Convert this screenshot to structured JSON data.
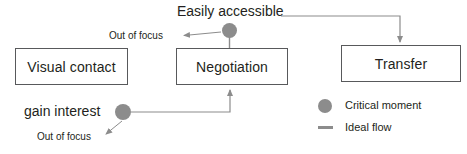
{
  "diagram": {
    "nodes": [
      {
        "id": "visual-contact",
        "label": "Visual contact"
      },
      {
        "id": "negotiation",
        "label": "Negotiation"
      },
      {
        "id": "transfer",
        "label": "Transfer"
      }
    ],
    "labels": {
      "easily_accessible": "Easily accessible",
      "gain_interest": "gain interest",
      "out_of_focus_top": "Out of focus",
      "out_of_focus_bottom": "Out of focus"
    },
    "legend": {
      "critical_moment": "Critical moment",
      "ideal_flow": "Ideal flow"
    },
    "colors": {
      "critical_moment_dot": "#8c8c8c",
      "box_border": "#58595b",
      "flow_line": "#8c8c8c",
      "text": "#231f20",
      "background": "#ffffff"
    }
  }
}
